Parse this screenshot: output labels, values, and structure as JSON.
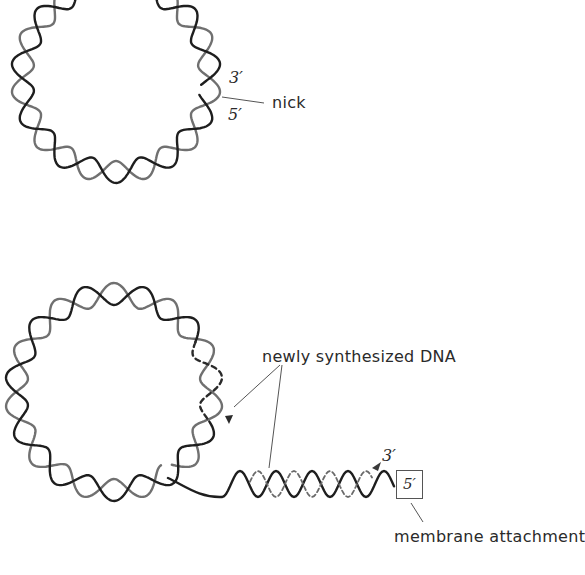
{
  "figure": {
    "panels": [
      {
        "id": "top",
        "description": "nicked circular double-stranded DNA",
        "labels": {
          "three_prime": "3′",
          "five_prime": "5′",
          "nick": "nick"
        }
      },
      {
        "id": "bottom",
        "description": "rolling circle with displaced linear strand",
        "labels": {
          "newly_synthesized": "newly synthesized DNA",
          "three_prime": "3′",
          "five_prime_box": "5′",
          "membrane": "membrane attachment"
        }
      }
    ]
  },
  "colors": {
    "background": "#ffffff",
    "strand_dark": "#1e1e1e",
    "strand_gray": "#6e6e6e",
    "new_strand": "#3a3a3a",
    "label_text": "#2a2a2a",
    "leader_line": "#555555"
  }
}
